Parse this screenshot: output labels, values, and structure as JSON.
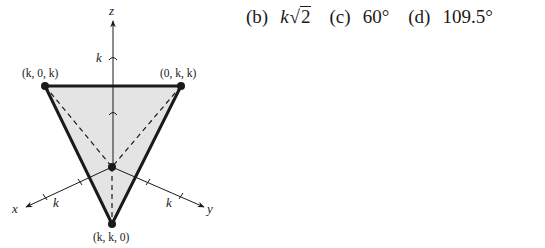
{
  "figure": {
    "axes": {
      "x": {
        "label": "x",
        "tick_label": "k"
      },
      "y": {
        "label": "y",
        "tick_label": "k"
      },
      "z": {
        "label": "z",
        "tick_label": "k"
      }
    },
    "vertices": [
      {
        "label": "(k, 0, k)",
        "name": "left-top"
      },
      {
        "label": "(0, k, k)",
        "name": "right-top"
      },
      {
        "label": "(k, k, 0)",
        "name": "bottom"
      }
    ],
    "colors": {
      "fill": "#e4e4e4",
      "stroke": "#1a1a1a"
    }
  },
  "answers": [
    {
      "key": "(b)",
      "value_prefix": "k",
      "value_sqrt": "2",
      "value": "k√2"
    },
    {
      "key": "(c)",
      "value": "60°"
    },
    {
      "key": "(d)",
      "value": "109.5°"
    }
  ]
}
